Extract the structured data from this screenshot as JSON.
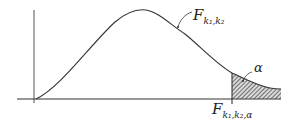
{
  "diagram": {
    "curve_label": {
      "main": "F",
      "subscript": "k₁,k₂"
    },
    "alpha_label": "α",
    "critical_value_label": {
      "main": "F",
      "subscript": "k₁,k₂,α"
    },
    "colors": {
      "ink": "#222222",
      "axis": "#444444",
      "background": "#ffffff"
    }
  }
}
